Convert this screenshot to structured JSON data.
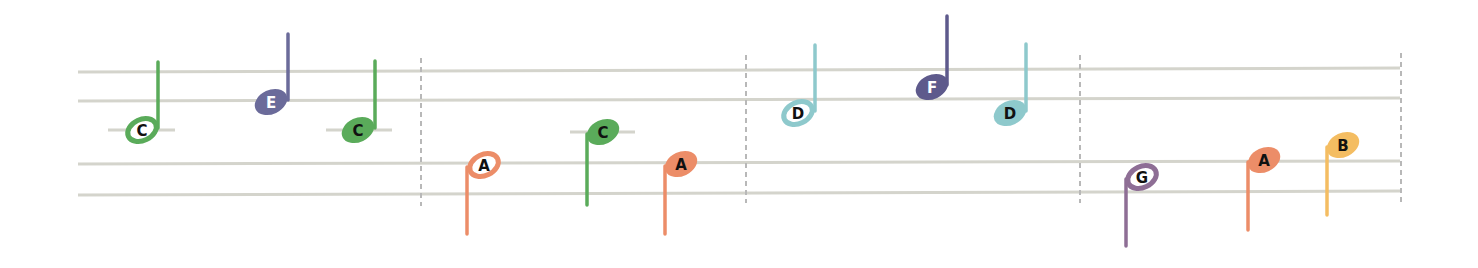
{
  "colors": {
    "C": "#5aab5a",
    "D": "#8ec9cc",
    "E": "#6b6b9a",
    "F": "#5e5a8c",
    "G": "#8e6e95",
    "A": "#ec8d68",
    "B": "#f4bd62",
    "staff": "#d4d4cc",
    "barline": "#b8b8b8"
  },
  "staff": {
    "x_start": 78,
    "x_end": 1400,
    "lines_left": [
      72,
      101,
      164,
      195
    ],
    "lines_right": [
      68,
      98,
      161,
      191
    ]
  },
  "barlines": [
    {
      "x": 421,
      "y1": 58,
      "y2": 206
    },
    {
      "x": 746,
      "y1": 55,
      "y2": 203
    },
    {
      "x": 1080,
      "y1": 55,
      "y2": 203
    },
    {
      "x": 1401,
      "y1": 53,
      "y2": 202
    }
  ],
  "measures": [
    {
      "notes": [
        {
          "letter": "C",
          "type": "half",
          "cx": 142,
          "cy": 130,
          "stem": "up",
          "stem_x": 158,
          "stem_end": 62,
          "ledger": [
            108,
            175
          ],
          "text_color": "#111111"
        },
        {
          "letter": "E",
          "type": "quarter",
          "cx": 271,
          "cy": 102,
          "stem": "up",
          "stem_x": 288,
          "stem_end": 34,
          "ledger": null,
          "text_color": "#ffffff"
        },
        {
          "letter": "C",
          "type": "quarter",
          "cx": 358,
          "cy": 130,
          "stem": "up",
          "stem_x": 375,
          "stem_end": 61,
          "ledger": [
            326,
            392
          ],
          "text_color": "#111111"
        }
      ]
    },
    {
      "notes": [
        {
          "letter": "A",
          "type": "half",
          "cx": 484,
          "cy": 165,
          "stem": "down",
          "stem_x": 467,
          "stem_end": 234,
          "ledger": null,
          "text_color": "#111111"
        },
        {
          "letter": "C",
          "type": "quarter",
          "cx": 603,
          "cy": 132,
          "stem": "down",
          "stem_x": 587,
          "stem_end": 205,
          "ledger": [
            570,
            635
          ],
          "text_color": "#111111"
        },
        {
          "letter": "A",
          "type": "quarter",
          "cx": 681,
          "cy": 164,
          "stem": "down",
          "stem_x": 665,
          "stem_end": 234,
          "ledger": null,
          "text_color": "#111111"
        }
      ]
    },
    {
      "notes": [
        {
          "letter": "D",
          "type": "half",
          "cx": 798,
          "cy": 113,
          "stem": "up",
          "stem_x": 815,
          "stem_end": 45,
          "ledger": null,
          "text_color": "#111111"
        },
        {
          "letter": "F",
          "type": "quarter",
          "cx": 932,
          "cy": 87,
          "stem": "up",
          "stem_x": 947,
          "stem_end": 16,
          "ledger": null,
          "text_color": "#ffffff"
        },
        {
          "letter": "D",
          "type": "quarter",
          "cx": 1010,
          "cy": 113,
          "stem": "up",
          "stem_x": 1026,
          "stem_end": 44,
          "ledger": null,
          "text_color": "#111111"
        }
      ]
    },
    {
      "notes": [
        {
          "letter": "G",
          "type": "half",
          "cx": 1142,
          "cy": 177,
          "stem": "down",
          "stem_x": 1126,
          "stem_end": 246,
          "ledger": null,
          "text_color": "#111111"
        },
        {
          "letter": "A",
          "type": "quarter",
          "cx": 1264,
          "cy": 160,
          "stem": "down",
          "stem_x": 1248,
          "stem_end": 230,
          "ledger": null,
          "text_color": "#111111"
        },
        {
          "letter": "B",
          "type": "quarter",
          "cx": 1343,
          "cy": 145,
          "stem": "down",
          "stem_x": 1327,
          "stem_end": 215,
          "ledger": null,
          "text_color": "#111111"
        }
      ]
    }
  ]
}
